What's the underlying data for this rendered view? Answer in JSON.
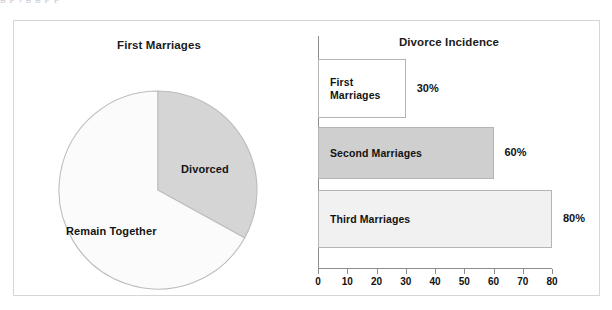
{
  "artifact": {
    "top_clipped_text": "g   p        ,                  g                                g     p        p"
  },
  "pie_panel": {
    "title": "First Marriages",
    "slices": [
      {
        "label": "Divorced",
        "value": 33,
        "color": "#d5d5d5",
        "label_x": 167,
        "label_y": 142
      },
      {
        "label": "Remain Together",
        "value": 67,
        "color": "#fbfbfb",
        "label_x": 52,
        "label_y": 204
      }
    ]
  },
  "bar_panel": {
    "title": "Divorce Incidence",
    "bars": [
      {
        "label": "First\nMarriages",
        "value": 30,
        "value_label": "30%",
        "color": "#ffffff"
      },
      {
        "label": "Second Marriages",
        "value": 60,
        "value_label": "60%",
        "color": "#cfcfcf"
      },
      {
        "label": "Third Marriages",
        "value": 80,
        "value_label": "80%",
        "color": "#f1f1f1"
      }
    ],
    "axis": {
      "ticks": [
        0,
        10,
        20,
        30,
        40,
        50,
        60,
        70,
        80
      ],
      "min": 0,
      "max": 80
    }
  },
  "chart_data": [
    {
      "type": "pie",
      "title": "First Marriages",
      "categories": [
        "Divorced",
        "Remain Together"
      ],
      "values": [
        33,
        67
      ],
      "colors": [
        "#d5d5d5",
        "#fbfbfb"
      ],
      "legend": "none",
      "labels_inline": true,
      "start_angle_deg": 0,
      "direction": "clockwise"
    },
    {
      "type": "bar",
      "orientation": "horizontal",
      "title": "Divorce Incidence",
      "categories": [
        "First Marriages",
        "Second Marriages",
        "Third Marriages"
      ],
      "values": [
        30,
        60,
        80
      ],
      "data_labels": [
        "30%",
        "60%",
        "80%"
      ],
      "colors": [
        "#ffffff",
        "#cfcfcf",
        "#f1f1f1"
      ],
      "xlabel": "",
      "ylabel": "",
      "xlim": [
        0,
        80
      ],
      "xticks": [
        0,
        10,
        20,
        30,
        40,
        50,
        60,
        70,
        80
      ],
      "grid": false,
      "legend": "none"
    }
  ]
}
